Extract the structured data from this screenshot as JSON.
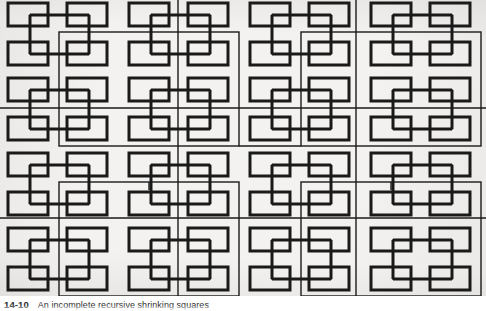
{
  "figure": {
    "title": "An incomplete recursive shrinking squares",
    "caption_number": "14-10",
    "caption_text": "An incomplete recursive shrinking squares",
    "background_color": "#f3f2f0",
    "ink_color": "#1a1a1a",
    "page_background": "#ffffff"
  },
  "geometry": {
    "canvas_width": 486,
    "canvas_height": 296,
    "grid_columns": 8,
    "grid_rows": 8,
    "base_rect_width": 40,
    "base_rect_height": 23,
    "recursion_levels": 3,
    "level_labels": [
      "level-1-base-rects",
      "level-2-medium-squares",
      "level-3-large-squares"
    ],
    "stroke_widths": [
      3.0,
      1.6,
      1.4
    ],
    "description": "Recursive H-tree of shrinking squares: 8x8 grid of thick base rectangles, linked by thin connector lines, overlaid by medium and large square outlines at successive recursion levels."
  },
  "chart_data": {
    "type": "diagram",
    "title": "An incomplete recursive shrinking squares",
    "recursion_levels": 3,
    "base_cells": 64,
    "series": [
      {
        "name": "level-1-base-rects",
        "count": 64,
        "rect_width": 40,
        "rect_height": 23,
        "stroke": 3.0
      },
      {
        "name": "level-2-medium-squares",
        "count": 16,
        "stroke": 1.6
      },
      {
        "name": "level-3-large-squares",
        "count": 4,
        "stroke": 1.4
      }
    ]
  }
}
